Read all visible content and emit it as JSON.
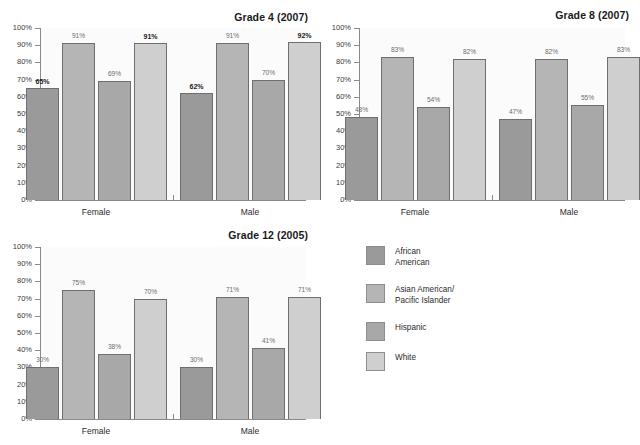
{
  "figure": {
    "series_names": [
      "African American",
      "Asian American/ Pacific Islander",
      "Hispanic",
      "White"
    ],
    "series_colors": [
      "#9a9a9a",
      "#b5b5b5",
      "#a8a8a8",
      "#cfcfcf"
    ],
    "groups": [
      "Female",
      "Male"
    ],
    "yticks": [
      "0%",
      "10%",
      "20%",
      "30%",
      "40%",
      "50%",
      "60%",
      "70%",
      "80%",
      "90%",
      "100%"
    ]
  },
  "legend": {
    "items": [
      {
        "label": "African\nAmerican",
        "color": "#9a9a9a"
      },
      {
        "label": "Asian American/\nPacific Islander",
        "color": "#b5b5b5"
      },
      {
        "label": "Hispanic",
        "color": "#a8a8a8"
      },
      {
        "label": "White",
        "color": "#cfcfcf"
      }
    ]
  },
  "chart_data": [
    {
      "type": "bar",
      "title": "Grade 4 (2007)",
      "categories": [
        "Female",
        "Male"
      ],
      "series": [
        {
          "name": "African American",
          "values": [
            65,
            62
          ],
          "labels": [
            "65%",
            "62%"
          ],
          "emphasis": [
            true,
            true
          ]
        },
        {
          "name": "Asian American/ Pacific Islander",
          "values": [
            91,
            91
          ],
          "labels": [
            "91%",
            "91%"
          ],
          "emphasis": [
            false,
            false
          ]
        },
        {
          "name": "Hispanic",
          "values": [
            69,
            70
          ],
          "labels": [
            "69%",
            "70%"
          ],
          "emphasis": [
            false,
            false
          ]
        },
        {
          "name": "White",
          "values": [
            91,
            92
          ],
          "labels": [
            "91%",
            "92%"
          ],
          "emphasis": [
            true,
            true
          ]
        }
      ],
      "xlabel": "",
      "ylabel": "",
      "ylim": [
        0,
        100
      ],
      "grid": false
    },
    {
      "type": "bar",
      "title": "Grade 8 (2007)",
      "categories": [
        "Female",
        "Male"
      ],
      "series": [
        {
          "name": "African American",
          "values": [
            48,
            47
          ],
          "labels": [
            "48%",
            "47%"
          ],
          "emphasis": [
            false,
            false
          ]
        },
        {
          "name": "Asian American/ Pacific Islander",
          "values": [
            83,
            82
          ],
          "labels": [
            "83%",
            "82%"
          ],
          "emphasis": [
            false,
            false
          ]
        },
        {
          "name": "Hispanic",
          "values": [
            54,
            55
          ],
          "labels": [
            "54%",
            "55%"
          ],
          "emphasis": [
            false,
            false
          ]
        },
        {
          "name": "White",
          "values": [
            82,
            83
          ],
          "labels": [
            "82%",
            "83%"
          ],
          "emphasis": [
            false,
            false
          ]
        }
      ],
      "xlabel": "",
      "ylabel": "",
      "ylim": [
        0,
        100
      ],
      "grid": false
    },
    {
      "type": "bar",
      "title": "Grade 12 (2005)",
      "categories": [
        "Female",
        "Male"
      ],
      "series": [
        {
          "name": "African American",
          "values": [
            30,
            30
          ],
          "labels": [
            "30%",
            "30%"
          ],
          "emphasis": [
            false,
            false
          ]
        },
        {
          "name": "Asian American/ Pacific Islander",
          "values": [
            75,
            71
          ],
          "labels": [
            "75%",
            "71%"
          ],
          "emphasis": [
            false,
            false
          ]
        },
        {
          "name": "Hispanic",
          "values": [
            38,
            41
          ],
          "labels": [
            "38%",
            "41%"
          ],
          "emphasis": [
            false,
            false
          ]
        },
        {
          "name": "White",
          "values": [
            70,
            71
          ],
          "labels": [
            "70%",
            "71%"
          ],
          "emphasis": [
            false,
            false
          ]
        }
      ],
      "xlabel": "",
      "ylabel": "",
      "ylim": [
        0,
        100
      ],
      "grid": false
    }
  ]
}
